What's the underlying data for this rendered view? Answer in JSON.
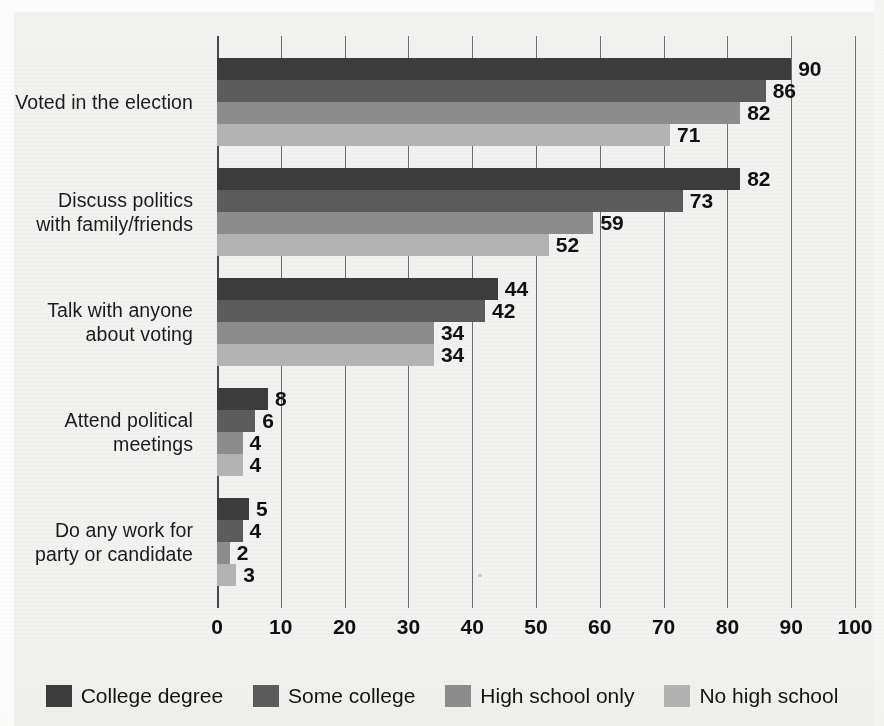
{
  "chart_data": {
    "type": "bar",
    "orientation": "horizontal",
    "title": "",
    "xlabel": "",
    "ylabel": "",
    "xlim": [
      0,
      100
    ],
    "xticks": [
      0,
      10,
      20,
      30,
      40,
      50,
      60,
      70,
      80,
      90,
      100
    ],
    "grid": true,
    "legend_position": "bottom",
    "categories": [
      "Voted in the election",
      "Discuss politics with family/friends",
      "Talk with anyone about voting",
      "Attend political meetings",
      "Do any work for party or candidate"
    ],
    "category_lines": [
      [
        "Voted in the election"
      ],
      [
        "Discuss politics",
        "with family/friends"
      ],
      [
        "Talk with anyone",
        "about voting"
      ],
      [
        "Attend political",
        "meetings"
      ],
      [
        "Do any work for",
        "party or candidate"
      ]
    ],
    "series": [
      {
        "name": "College degree",
        "color": "#3c3c3c",
        "values": [
          90,
          82,
          44,
          8,
          5
        ]
      },
      {
        "name": "Some college",
        "color": "#5c5c5c",
        "values": [
          86,
          73,
          42,
          6,
          4
        ]
      },
      {
        "name": "High school only",
        "color": "#8d8d8d",
        "values": [
          82,
          59,
          34,
          4,
          2
        ]
      },
      {
        "name": "No high school",
        "color": "#b4b4b4",
        "values": [
          71,
          52,
          34,
          4,
          3
        ]
      }
    ]
  },
  "legend": {
    "entries": [
      {
        "label": "College degree",
        "color": "#3c3c3c"
      },
      {
        "label": "Some college",
        "color": "#5c5c5c"
      },
      {
        "label": "High school only",
        "color": "#8d8d8d"
      },
      {
        "label": "No high school",
        "color": "#b4b4b4"
      }
    ]
  }
}
